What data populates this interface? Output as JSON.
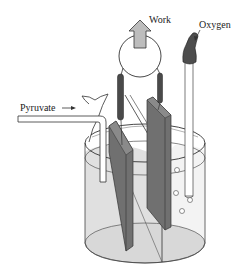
{
  "diagram": {
    "type": "fuel-cell-analogy",
    "labels": {
      "work": "Work",
      "oxygen": "Oxygen",
      "pyruvate": "Pyruvate"
    },
    "components": [
      "beaker",
      "divider-membrane",
      "left-electrode",
      "right-electrode",
      "circuit-loop",
      "work-arrow",
      "pyruvate-inlet-tube",
      "oxygen-inlet-tube",
      "oxygen-bubbles"
    ],
    "colors": {
      "outline": "#333333",
      "electrode": "#6e6e6e",
      "electrode-dark": "#4a4a4a",
      "liquid": "#e2e2e2",
      "liquid-right": "#f2f2f2",
      "arrow-fill": "#bdbdbd",
      "oxygen-cap": "#4d4d4d"
    }
  }
}
